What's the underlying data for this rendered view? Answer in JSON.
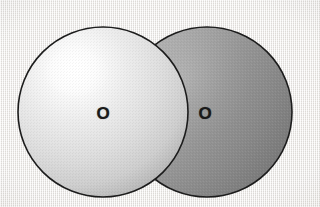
{
  "figure": {
    "kind": "space-filling-molecular-model",
    "molecule_name": "oxygen",
    "molecular_formula": "O2",
    "background_color": "#ebe9e6",
    "outline_color": "#1c1c1c",
    "atom_count": 2,
    "bond_type": "overlapping-spheres"
  },
  "atoms": [
    {
      "id": "atom-left",
      "element_symbol": "O",
      "element_name": "oxygen",
      "sphere_fill_light": "#fdfdfd",
      "sphere_fill_mid": "#dcdcdc",
      "sphere_fill_dark": "#b6b6b6",
      "highlight_color": "#ffffff",
      "center_x": 103,
      "center_y": 112,
      "radius": 85
    },
    {
      "id": "atom-right",
      "element_symbol": "O",
      "element_name": "oxygen",
      "sphere_fill_light": "#b0b0b0",
      "sphere_fill_mid": "#949494",
      "sphere_fill_dark": "#7a7a7a",
      "highlight_color": "#c2c2c2",
      "center_x": 207,
      "center_y": 112,
      "radius": 85
    }
  ]
}
